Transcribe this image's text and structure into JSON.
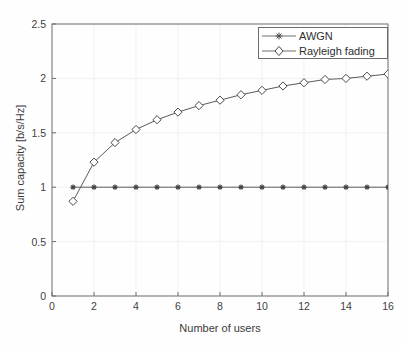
{
  "chart_data": {
    "type": "line",
    "title": "",
    "xlabel": "Number of users",
    "ylabel": "Sum capacity [b/s/Hz]",
    "xlim": [
      0,
      16
    ],
    "ylim": [
      0,
      2.5
    ],
    "xticks": [
      "0",
      "2",
      "4",
      "6",
      "8",
      "10",
      "12",
      "14",
      "16"
    ],
    "yticks": [
      "0",
      "0.5",
      "1",
      "1.5",
      "2",
      "2.5"
    ],
    "grid": true,
    "legend_position": "top-right-inside",
    "x": [
      1,
      2,
      3,
      4,
      5,
      6,
      7,
      8,
      9,
      10,
      11,
      12,
      13,
      14,
      15,
      16
    ],
    "series": [
      {
        "name": "AWGN",
        "marker": "asterisk-marker",
        "color": "#5a5a5a",
        "values": [
          1.0,
          1.0,
          1.0,
          1.0,
          1.0,
          1.0,
          1.0,
          1.0,
          1.0,
          1.0,
          1.0,
          1.0,
          1.0,
          1.0,
          1.0,
          1.0
        ]
      },
      {
        "name": "Rayleigh fading",
        "marker": "diamond-marker",
        "color": "#5a5a5a",
        "values": [
          0.87,
          1.23,
          1.41,
          1.53,
          1.62,
          1.69,
          1.75,
          1.8,
          1.85,
          1.89,
          1.93,
          1.96,
          1.99,
          2.0,
          2.02,
          2.04
        ]
      }
    ]
  },
  "legend": {
    "entries": [
      {
        "label": "AWGN",
        "marker": "asterisk-marker"
      },
      {
        "label": "Rayleigh fading",
        "marker": "diamond-marker"
      }
    ]
  },
  "axes": {
    "x_label": "Number of users",
    "y_label": "Sum capacity [b/s/Hz]"
  },
  "colors": {
    "axis": "#6b6b6b",
    "grid": "#f2f2f2",
    "line": "#6e6e6e",
    "text": "#3a3a3a",
    "background": "#fefefe"
  }
}
